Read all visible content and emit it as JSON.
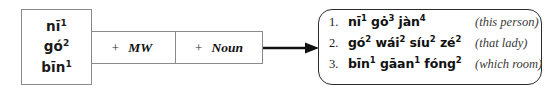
{
  "diagram": {
    "determiners": {
      "name": "determiner-slot",
      "items": [
        {
          "base": "n",
          "vowel": "ī",
          "tail": "",
          "tone": "1",
          "full": "nī¹"
        },
        {
          "base": "g",
          "vowel": "ó",
          "tail": "",
          "tone": "2",
          "full": "gó²"
        },
        {
          "base": "b",
          "vowel": "ī",
          "tail": "n",
          "tone": "1",
          "full": "bīn¹"
        }
      ]
    },
    "slots": [
      {
        "plus": "+",
        "label": "MW",
        "name": "measure-word"
      },
      {
        "plus": "+",
        "label": "Noun",
        "name": "noun"
      }
    ],
    "arrow": {
      "icon": "right-arrow-icon",
      "color": "#111111"
    },
    "results": [
      {
        "number": "1.",
        "phrase": "nī¹ gȯ³ jàn⁴",
        "phrase_parts": [
          {
            "text": "nī",
            "tone": "1"
          },
          {
            "text": "gȯ",
            "tone": "3"
          },
          {
            "text": "jàn",
            "tone": "4"
          }
        ],
        "gloss": "(this person)"
      },
      {
        "number": "2.",
        "phrase": "gó² wái² síu² zé²",
        "phrase_parts": [
          {
            "text": "gó",
            "tone": "2"
          },
          {
            "text": "wái",
            "tone": "2"
          },
          {
            "text": "síu",
            "tone": "2"
          },
          {
            "text": "zé",
            "tone": "2"
          }
        ],
        "gloss": "(that lady)"
      },
      {
        "number": "3.",
        "phrase": "bīn¹ gāan¹ fóng²",
        "phrase_parts": [
          {
            "text": "bīn",
            "tone": "1"
          },
          {
            "text": "gāan",
            "tone": "1"
          },
          {
            "text": "fóng",
            "tone": "2"
          }
        ],
        "gloss": "(which room)"
      }
    ],
    "colors": {
      "box_border_light": "#8a8a8a",
      "box_border_dark": "#2b2b2b",
      "text": "#111111",
      "gloss_text": "#3a3a3a",
      "background": "#ffffff"
    }
  }
}
